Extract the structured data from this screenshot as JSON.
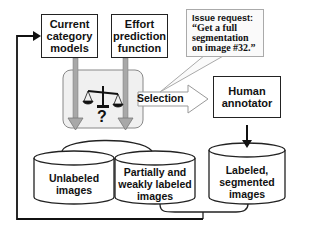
{
  "diagram": {
    "type": "flowchart",
    "nodes": {
      "current_models": {
        "label": "Current category models"
      },
      "effort_function": {
        "label": "Effort prediction function"
      },
      "human_annotator": {
        "label": "Human annotator"
      },
      "unlabeled": {
        "label": "Unlabeled images"
      },
      "partial": {
        "label": "Partially and weakly labeled images"
      },
      "labeled": {
        "label": "Labeled, segmented images"
      }
    },
    "decision": {
      "icon": "balance-scale-icon",
      "mark": "?"
    },
    "selection_label": "Selection",
    "callout": {
      "title": "Issue request:",
      "quote_line1": "“Get a full",
      "quote_line2": "segmentation",
      "quote_line3": "on image #32.”"
    },
    "edges": [
      {
        "from": "current_models",
        "to": "decision"
      },
      {
        "from": "effort_function",
        "to": "decision"
      },
      {
        "from": "unlabeled",
        "to": "decision"
      },
      {
        "from": "partial",
        "to": "decision"
      },
      {
        "from": "decision",
        "to": "human_annotator",
        "label": "Selection"
      },
      {
        "from": "human_annotator",
        "to": "labeled"
      },
      {
        "from": "labeled",
        "to": "current_models"
      },
      {
        "from": "partial",
        "to": "current_models"
      }
    ]
  }
}
